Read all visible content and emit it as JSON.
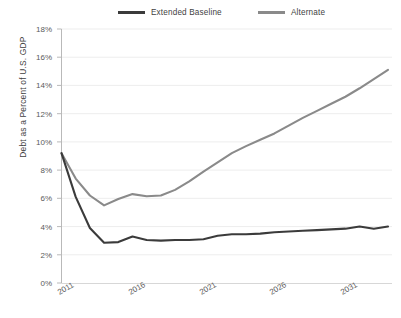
{
  "chart_data": {
    "type": "line",
    "title": "",
    "xlabel": "",
    "ylabel": "Debt as a Percent of U.S. GDP",
    "xlim": [
      2011,
      2034
    ],
    "ylim": [
      0,
      18
    ],
    "y_tick_labels": [
      "0%",
      "2%",
      "4%",
      "6%",
      "8%",
      "10%",
      "12%",
      "14%",
      "16%",
      "18%"
    ],
    "y_tick_values": [
      0,
      2,
      4,
      6,
      8,
      10,
      12,
      14,
      16,
      18
    ],
    "x_tick_labels": [
      "2011",
      "2016",
      "2021",
      "2026",
      "2031"
    ],
    "x_tick_values": [
      2011,
      2016,
      2021,
      2026,
      2031
    ],
    "grid": true,
    "legend_position": "top",
    "x": [
      2011,
      2012,
      2013,
      2014,
      2015,
      2016,
      2017,
      2018,
      2019,
      2020,
      2021,
      2022,
      2023,
      2024,
      2025,
      2026,
      2027,
      2028,
      2029,
      2030,
      2031,
      2032,
      2033,
      2034
    ],
    "series": [
      {
        "name": "Extended Baseline",
        "color": "#3b3b3b",
        "values": [
          9.2,
          6.1,
          3.9,
          2.85,
          2.9,
          3.3,
          3.05,
          3.0,
          3.05,
          3.05,
          3.1,
          3.35,
          3.45,
          3.45,
          3.5,
          3.6,
          3.65,
          3.7,
          3.75,
          3.8,
          3.85,
          4.0,
          3.85,
          4.0
        ]
      },
      {
        "name": "Alternate",
        "color": "#8a8a8a",
        "values": [
          9.2,
          7.4,
          6.2,
          5.5,
          5.95,
          6.3,
          6.15,
          6.2,
          6.6,
          7.2,
          7.9,
          8.55,
          9.2,
          9.7,
          10.15,
          10.6,
          11.15,
          11.7,
          12.2,
          12.7,
          13.2,
          13.8,
          14.45,
          15.1
        ]
      }
    ]
  },
  "legend": {
    "items": [
      {
        "label": "Extended Baseline",
        "color": "#3b3b3b"
      },
      {
        "label": "Alternate",
        "color": "#8a8a8a"
      }
    ]
  },
  "axes": {
    "y_title": "Debt as a Percent of U.S. GDP",
    "y_labels": [
      "18%",
      "16%",
      "14%",
      "12%",
      "10%",
      "8%",
      "6%",
      "4%",
      "2%",
      "0%"
    ],
    "x_labels": [
      "2011",
      "2016",
      "2021",
      "2026",
      "2031"
    ]
  },
  "colors": {
    "baseline_line": "#3b3b3b",
    "alternate_line": "#8a8a8a",
    "axis": "#b9b9b9",
    "grid": "#ededed",
    "text": "#4a4a4a",
    "background": "#ffffff"
  }
}
